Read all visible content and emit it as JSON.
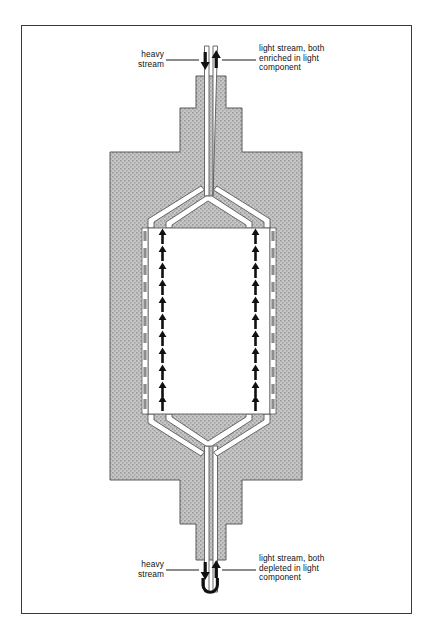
{
  "figure": {
    "type": "process-flow-cross-section",
    "frame": {
      "border_color": "#3a3a3a"
    },
    "colors": {
      "body_fill": "#b9b9b9",
      "channel_fill": "#ffffff",
      "outline": "#4a4a4a",
      "arrow": "#111111",
      "wall_dash": "#8d8d8d",
      "text": "#111111"
    }
  },
  "labels": {
    "top_left": "heavy\nstream",
    "top_right": "light stream, both\nenriched in light\ncomponent",
    "bottom_left": "heavy\nstream",
    "bottom_right": "light stream, both\ndepleted in light\ncomponent"
  },
  "flow_markers": {
    "top_pair": {
      "left_arrow": "down",
      "right_arrow": "up",
      "count": 2
    },
    "bottom_pair": {
      "left_arrow": "down",
      "right_arrow": "up",
      "count": 2
    },
    "bottom_uturn": "U",
    "chamber_arrow_direction": "up",
    "chamber_arrow_rows": 11,
    "chamber_arrow_columns": 2,
    "wall_dash_rows": 11,
    "wall_dash_columns": 2
  },
  "geometry": {
    "chamber_top_y": 228,
    "chamber_bottom_y": 414,
    "body_left_x": 110,
    "body_right_x": 302,
    "stem_center_x": 211
  }
}
